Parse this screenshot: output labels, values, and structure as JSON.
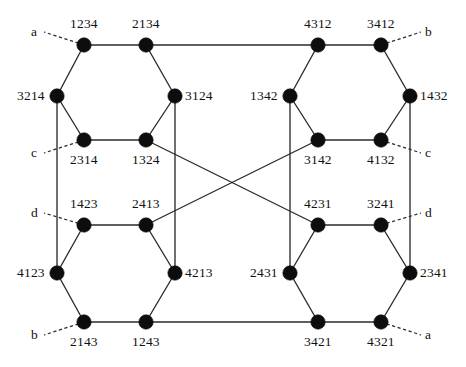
{
  "figure": {
    "background_color": "#ffffff",
    "node_color": "#0d0d0d",
    "edge_color": "#2b2b2b",
    "width": 466,
    "height": 367
  },
  "nodes": [
    {
      "id": "n1",
      "label": "1234",
      "x": 84,
      "y": 45,
      "label_dx": 0,
      "label_dy": -21,
      "label_align": "center"
    },
    {
      "id": "n2",
      "label": "2134",
      "x": 146,
      "y": 45,
      "label_dx": 0,
      "label_dy": -21,
      "label_align": "center"
    },
    {
      "id": "n3",
      "label": "4312",
      "x": 318,
      "y": 45,
      "label_dx": 0,
      "label_dy": -21,
      "label_align": "center"
    },
    {
      "id": "n4",
      "label": "3412",
      "x": 381,
      "y": 45,
      "label_dx": 0,
      "label_dy": -21,
      "label_align": "center"
    },
    {
      "id": "n5",
      "label": "3214",
      "x": 57,
      "y": 96,
      "label_dx": -12,
      "label_dy": 0,
      "label_align": "right"
    },
    {
      "id": "n6",
      "label": "3124",
      "x": 175,
      "y": 96,
      "label_dx": 10,
      "label_dy": 0,
      "label_align": "left"
    },
    {
      "id": "n7",
      "label": "1342",
      "x": 290,
      "y": 96,
      "label_dx": -12,
      "label_dy": 0,
      "label_align": "right"
    },
    {
      "id": "n8",
      "label": "1432",
      "x": 410,
      "y": 96,
      "label_dx": 10,
      "label_dy": 0,
      "label_align": "left"
    },
    {
      "id": "n9",
      "label": "2314",
      "x": 84,
      "y": 140,
      "label_dx": 0,
      "label_dy": 20,
      "label_align": "center"
    },
    {
      "id": "n10",
      "label": "1324",
      "x": 146,
      "y": 140,
      "label_dx": 0,
      "label_dy": 20,
      "label_align": "center"
    },
    {
      "id": "n11",
      "label": "3142",
      "x": 318,
      "y": 140,
      "label_dx": 0,
      "label_dy": 20,
      "label_align": "center"
    },
    {
      "id": "n12",
      "label": "4132",
      "x": 381,
      "y": 140,
      "label_dx": 0,
      "label_dy": 20,
      "label_align": "center"
    },
    {
      "id": "n13",
      "label": "1423",
      "x": 84,
      "y": 225,
      "label_dx": 0,
      "label_dy": -21,
      "label_align": "center"
    },
    {
      "id": "n14",
      "label": "2413",
      "x": 146,
      "y": 225,
      "label_dx": 0,
      "label_dy": -21,
      "label_align": "center"
    },
    {
      "id": "n15",
      "label": "4231",
      "x": 318,
      "y": 225,
      "label_dx": 0,
      "label_dy": -21,
      "label_align": "center"
    },
    {
      "id": "n16",
      "label": "3241",
      "x": 381,
      "y": 225,
      "label_dx": 0,
      "label_dy": -21,
      "label_align": "center"
    },
    {
      "id": "n17",
      "label": "4123",
      "x": 57,
      "y": 273,
      "label_dx": -12,
      "label_dy": 0,
      "label_align": "right"
    },
    {
      "id": "n18",
      "label": "4213",
      "x": 175,
      "y": 273,
      "label_dx": 10,
      "label_dy": 0,
      "label_align": "left"
    },
    {
      "id": "n19",
      "label": "2431",
      "x": 290,
      "y": 273,
      "label_dx": -12,
      "label_dy": 0,
      "label_align": "right"
    },
    {
      "id": "n20",
      "label": "2341",
      "x": 410,
      "y": 273,
      "label_dx": 10,
      "label_dy": 0,
      "label_align": "left"
    },
    {
      "id": "n21",
      "label": "2143",
      "x": 84,
      "y": 322,
      "label_dx": 0,
      "label_dy": 20,
      "label_align": "center"
    },
    {
      "id": "n22",
      "label": "1243",
      "x": 146,
      "y": 322,
      "label_dx": 0,
      "label_dy": 20,
      "label_align": "center"
    },
    {
      "id": "n23",
      "label": "3421",
      "x": 318,
      "y": 322,
      "label_dx": 0,
      "label_dy": 20,
      "label_align": "center"
    },
    {
      "id": "n24",
      "label": "4321",
      "x": 381,
      "y": 322,
      "label_dx": 0,
      "label_dy": 20,
      "label_align": "center"
    }
  ],
  "edges": [
    {
      "from": "n1",
      "to": "n2",
      "kind": "solid"
    },
    {
      "from": "n2",
      "to": "n3",
      "kind": "solid"
    },
    {
      "from": "n3",
      "to": "n4",
      "kind": "solid"
    },
    {
      "from": "n1",
      "to": "n5",
      "kind": "solid"
    },
    {
      "from": "n2",
      "to": "n6",
      "kind": "solid"
    },
    {
      "from": "n3",
      "to": "n7",
      "kind": "solid"
    },
    {
      "from": "n4",
      "to": "n8",
      "kind": "solid"
    },
    {
      "from": "n5",
      "to": "n9",
      "kind": "solid"
    },
    {
      "from": "n6",
      "to": "n10",
      "kind": "solid"
    },
    {
      "from": "n7",
      "to": "n11",
      "kind": "solid"
    },
    {
      "from": "n8",
      "to": "n12",
      "kind": "solid"
    },
    {
      "from": "n9",
      "to": "n10",
      "kind": "solid"
    },
    {
      "from": "n11",
      "to": "n12",
      "kind": "solid"
    },
    {
      "from": "n5",
      "to": "n17",
      "kind": "solid"
    },
    {
      "from": "n6",
      "to": "n18",
      "kind": "solid"
    },
    {
      "from": "n7",
      "to": "n19",
      "kind": "solid"
    },
    {
      "from": "n8",
      "to": "n20",
      "kind": "solid"
    },
    {
      "from": "n10",
      "to": "n15",
      "kind": "solid"
    },
    {
      "from": "n11",
      "to": "n14",
      "kind": "solid"
    },
    {
      "from": "n13",
      "to": "n14",
      "kind": "solid"
    },
    {
      "from": "n15",
      "to": "n16",
      "kind": "solid"
    },
    {
      "from": "n13",
      "to": "n17",
      "kind": "solid"
    },
    {
      "from": "n14",
      "to": "n18",
      "kind": "solid"
    },
    {
      "from": "n15",
      "to": "n19",
      "kind": "solid"
    },
    {
      "from": "n16",
      "to": "n20",
      "kind": "solid"
    },
    {
      "from": "n17",
      "to": "n21",
      "kind": "solid"
    },
    {
      "from": "n18",
      "to": "n22",
      "kind": "solid"
    },
    {
      "from": "n19",
      "to": "n23",
      "kind": "solid"
    },
    {
      "from": "n20",
      "to": "n24",
      "kind": "solid"
    },
    {
      "from": "n21",
      "to": "n22",
      "kind": "solid"
    },
    {
      "from": "n22",
      "to": "n23",
      "kind": "solid"
    },
    {
      "from": "n23",
      "to": "n24",
      "kind": "solid"
    }
  ],
  "port_edges": [
    {
      "id": "p-a-top",
      "label": "a",
      "node": "n1",
      "x": 44,
      "y": 32,
      "label_dx": -13,
      "label_dy": -7
    },
    {
      "id": "p-b-top",
      "label": "b",
      "node": "n4",
      "x": 421,
      "y": 32,
      "label_dx": 4,
      "label_dy": -7
    },
    {
      "id": "p-c-left",
      "label": "c",
      "node": "n9",
      "x": 44,
      "y": 153,
      "label_dx": -13,
      "label_dy": -7
    },
    {
      "id": "p-c-right",
      "label": "c",
      "node": "n12",
      "x": 421,
      "y": 153,
      "label_dx": 4,
      "label_dy": -7
    },
    {
      "id": "p-d-left",
      "label": "d",
      "node": "n13",
      "x": 44,
      "y": 213,
      "label_dx": -13,
      "label_dy": -7
    },
    {
      "id": "p-d-right",
      "label": "d",
      "node": "n16",
      "x": 421,
      "y": 213,
      "label_dx": 4,
      "label_dy": -7
    },
    {
      "id": "p-b-bottom",
      "label": "b",
      "node": "n21",
      "x": 44,
      "y": 335,
      "label_dx": -13,
      "label_dy": -7
    },
    {
      "id": "p-a-bottom",
      "label": "a",
      "node": "n24",
      "x": 421,
      "y": 335,
      "label_dx": 4,
      "label_dy": -7
    }
  ],
  "node_radius": 7.2
}
